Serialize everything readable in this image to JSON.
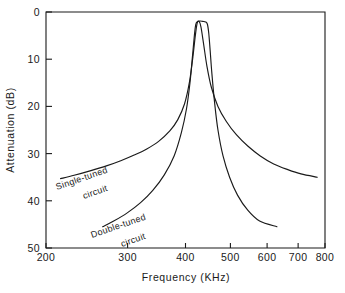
{
  "chart_data": {
    "type": "line",
    "title": "",
    "xlabel": "Frequency  (KHz)",
    "ylabel": "Attenuation  (dB)",
    "xscale": "log",
    "xlim": [
      200,
      800
    ],
    "ylim": [
      0,
      50
    ],
    "y_inverted": true,
    "grid": false,
    "legend": "inline-curve-labels",
    "xticks": [
      200,
      300,
      400,
      500,
      600,
      700,
      800
    ],
    "xticklabels": [
      "200",
      "300",
      "400",
      "500",
      "600",
      "700",
      "800"
    ],
    "yticks": [
      0,
      10,
      20,
      30,
      40,
      50
    ],
    "yticklabels": [
      "0",
      "10",
      "20",
      "30",
      "40",
      "50"
    ],
    "series": [
      {
        "name": "Single-tuned circuit",
        "label": "Single-tuned",
        "label_line2": "circuit",
        "x": [
          215,
          230,
          250,
          270,
          290,
          310,
          330,
          350,
          370,
          385,
          398,
          408,
          415,
          420,
          424,
          428,
          432,
          438,
          445,
          455,
          470,
          490,
          515,
          545,
          580,
          620,
          665,
          710,
          770
        ],
        "y": [
          35.3,
          34.6,
          33.6,
          32.6,
          31.5,
          30.3,
          29.0,
          27.4,
          25.2,
          22.8,
          19.5,
          14.8,
          9.5,
          5.0,
          2.3,
          2.0,
          3.2,
          7.0,
          11.5,
          16.0,
          20.0,
          23.2,
          26.0,
          28.4,
          30.5,
          32.2,
          33.4,
          34.3,
          35.0
        ]
      },
      {
        "name": "Double-tuned circuit",
        "label": "Double-tuned",
        "label_line2": "circuit",
        "x": [
          265,
          280,
          300,
          320,
          340,
          360,
          378,
          392,
          402,
          409,
          414,
          418,
          421,
          425,
          430,
          436,
          442,
          446,
          449,
          452,
          456,
          462,
          470,
          482,
          498,
          518,
          545,
          578,
          630
        ],
        "y": [
          45.5,
          44.3,
          42.5,
          40.4,
          37.8,
          34.5,
          30.5,
          25.5,
          20.5,
          15.0,
          9.5,
          5.0,
          2.6,
          2.0,
          1.9,
          2.0,
          2.1,
          2.6,
          4.5,
          8.0,
          13.0,
          19.0,
          25.0,
          30.5,
          35.0,
          38.8,
          42.0,
          44.3,
          45.5
        ]
      }
    ],
    "annotations": [
      {
        "text": "Single-tuned",
        "text2": "circuit",
        "near": "single-tuned-curve"
      },
      {
        "text": "Double-tuned",
        "text2": "circuit",
        "near": "double-tuned-curve"
      }
    ]
  }
}
